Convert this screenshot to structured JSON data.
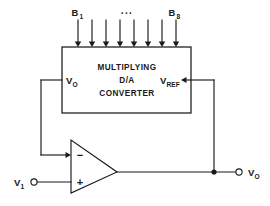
{
  "diagram": {
    "block": {
      "name": "multiplying-dac-block",
      "line1": "MULTIPLYING",
      "line2": "D/A",
      "line3": "CONVERTER",
      "left_port_label": "V",
      "left_port_sub": "O",
      "right_port_label": "V",
      "right_port_sub": "REF"
    },
    "digital_inputs": {
      "first_label": "B",
      "first_sub": "1",
      "last_label": "B",
      "last_sub": "8",
      "ellipsis": "...",
      "count": 8
    },
    "opamp": {
      "name": "operational-amplifier",
      "inverting_sign": "−",
      "noninverting_sign": "+"
    },
    "terminals": {
      "input_label": "V",
      "input_sub": "1",
      "output_label": "V",
      "output_sub": "O"
    },
    "colors": {
      "ink": "#1a1a1a",
      "background": "#ffffff"
    }
  }
}
